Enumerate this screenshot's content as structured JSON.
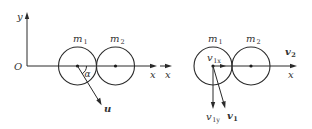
{
  "diagram": {
    "left_panel": {
      "axes": {
        "origin_label": "O",
        "y_label": "y",
        "x_label": "x"
      },
      "ball1": {
        "label": "m",
        "sub": "1"
      },
      "ball2": {
        "label": "m",
        "sub": "2"
      },
      "angle_label": "α",
      "velocity": {
        "label": "u",
        "bold": true
      }
    },
    "right_panel": {
      "x_label": "x",
      "ball1": {
        "label": "m",
        "sub": "1"
      },
      "ball2": {
        "label": "m",
        "sub": "2"
      },
      "v1x": {
        "label": "v",
        "sub": "1x"
      },
      "v1y": {
        "label": "v",
        "sub": "1y"
      },
      "v1": {
        "label": "v",
        "sub": "1",
        "bold": true
      },
      "v2": {
        "label": "v",
        "sub": "2",
        "bold": true
      }
    }
  }
}
